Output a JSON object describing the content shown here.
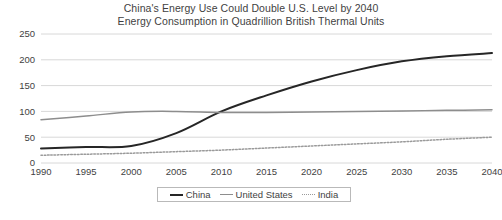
{
  "figure": {
    "title_line1": "China's Energy Use Could Double U.S. Level by 2040",
    "title_line2": "Energy Consumption in Quadrillion British Thermal Units",
    "caption": "",
    "colors": {
      "china": "#262626",
      "united_states": "#8d8d8d",
      "india": "#9a9a9a",
      "gridline": "#d8d8d8",
      "text": "#3f3f3f"
    }
  },
  "legend": {
    "position": "bottom-center",
    "entries": [
      {
        "label": "China",
        "style": "solid",
        "key": "china"
      },
      {
        "label": "United States",
        "style": "solid",
        "key": "us"
      },
      {
        "label": "India",
        "style": "dotted",
        "key": "india"
      }
    ]
  },
  "chart_data": {
    "type": "line",
    "title": "China's Energy Use Could Double U.S. Level by 2040",
    "subtitle": "Energy Consumption in Quadrillion British Thermal Units",
    "xlabel": "",
    "ylabel": "",
    "x": [
      1990,
      1995,
      2000,
      2005,
      2010,
      2015,
      2020,
      2025,
      2030,
      2035,
      2040
    ],
    "xtick_labels": [
      "1990",
      "1995",
      "2000",
      "2005",
      "2010",
      "2015",
      "2020",
      "2025",
      "2030",
      "2035",
      "2040"
    ],
    "ytick_labels": [
      "0",
      "50",
      "100",
      "150",
      "200",
      "250"
    ],
    "yticks": [
      0,
      50,
      100,
      150,
      200,
      250
    ],
    "xlim": [
      1990,
      2040
    ],
    "ylim": [
      0,
      250
    ],
    "grid": true,
    "grid_axis": "y",
    "series": [
      {
        "name": "China",
        "style": "solid",
        "width": 2,
        "color": "#262626",
        "values": [
          28,
          31,
          33,
          58,
          100,
          131,
          158,
          180,
          197,
          207,
          213
        ]
      },
      {
        "name": "United States",
        "style": "solid",
        "width": 1.5,
        "color": "#8d8d8d",
        "values": [
          84,
          91,
          99,
          100,
          98,
          98,
          99,
          100,
          101,
          102,
          103
        ]
      },
      {
        "name": "India",
        "style": "dotted",
        "width": 1.5,
        "color": "#9a9a9a",
        "values": [
          15,
          17,
          19,
          22,
          25,
          29,
          33,
          37,
          41,
          46,
          50
        ]
      }
    ]
  }
}
